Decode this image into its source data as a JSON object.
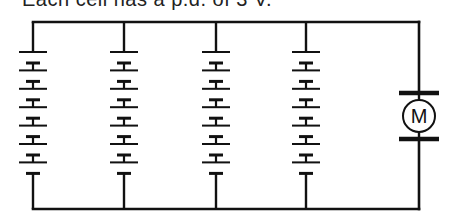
{
  "caption": "Each cell has a p.d. of 3 V.",
  "diagram": {
    "type": "circuit",
    "colors": {
      "wire": "#111111",
      "background": "#ffffff"
    },
    "branches": [
      {
        "name": "branch-1",
        "x": 33,
        "cells": 7
      },
      {
        "name": "branch-2",
        "x": 124,
        "cells": 7
      },
      {
        "name": "branch-3",
        "x": 216,
        "cells": 7
      },
      {
        "name": "branch-4",
        "x": 306,
        "cells": 7
      }
    ],
    "motor": {
      "label": "M",
      "x": 419,
      "cy": 116,
      "r": 16
    },
    "wires": {
      "top_y": 22,
      "bottom_y": 209,
      "left_x": 33,
      "right_x": 419
    },
    "cell_layout": {
      "first_long_y": 52,
      "pitch": 18.4,
      "short_offset": 11,
      "long_half": 14,
      "short_half": 7
    }
  }
}
